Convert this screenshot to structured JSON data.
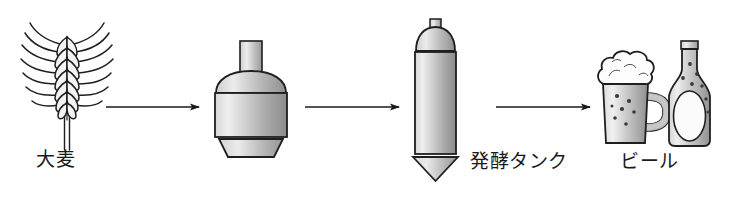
{
  "diagram": {
    "background_color": "#ffffff",
    "line_color": "#1a1a1a",
    "fill_light": "#e8e8e8",
    "fill_mid": "#b4b4b4",
    "fill_dark": "#808080",
    "width": 741,
    "height": 204,
    "stages": [
      {
        "id": "barley",
        "icon": "barley-ear-icon",
        "label": "大麦",
        "order": 1
      },
      {
        "id": "brew-kettle",
        "icon": "brew-kettle-icon",
        "label": "",
        "order": 2
      },
      {
        "id": "fermentation-tank",
        "icon": "fermentation-tank-icon",
        "label": "発酵タンク",
        "order": 3
      },
      {
        "id": "beer",
        "icon": "beer-mug-and-bottle-icon",
        "label": "ビール",
        "order": 4
      }
    ],
    "arrows": [
      {
        "id": "arrow-1",
        "from": "barley",
        "to": "brew-kettle",
        "direction": "right"
      },
      {
        "id": "arrow-2",
        "from": "brew-kettle",
        "to": "fermentation-tank",
        "direction": "right"
      },
      {
        "id": "arrow-3",
        "from": "fermentation-tank",
        "to": "beer",
        "direction": "right"
      }
    ]
  }
}
